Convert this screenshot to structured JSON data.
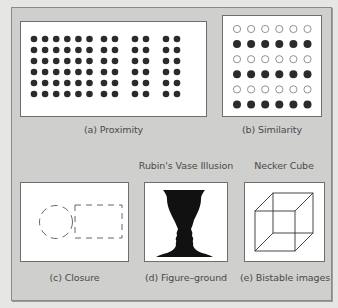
{
  "figure": {
    "panels": [
      {
        "id": "proximity",
        "caption": "(a) Proximity",
        "title": ""
      },
      {
        "id": "similarity",
        "caption": "(b) Similarity",
        "title": ""
      },
      {
        "id": "closure",
        "caption": "(c) Closure",
        "title": ""
      },
      {
        "id": "figure-ground",
        "caption": "(d) Figure–ground",
        "title": "Rubin's Vase Illusion"
      },
      {
        "id": "bistable",
        "caption": "(e) Bistable images",
        "title": "Necker Cube"
      }
    ],
    "proximity": {
      "rows": 6,
      "left_group_columns": 6,
      "right_group_pairs": 3,
      "columns_per_pair": 2
    },
    "similarity": {
      "rows": 6,
      "columns": 6,
      "row_styles": [
        "open",
        "filled",
        "open",
        "filled",
        "open",
        "filled"
      ]
    },
    "closure": {
      "shapes": [
        "dashed-circle",
        "dashed-rectangle"
      ]
    },
    "colors": {
      "dot": "#2b2b2b",
      "ink": "#111111",
      "frame": "#cfcfcd"
    }
  }
}
